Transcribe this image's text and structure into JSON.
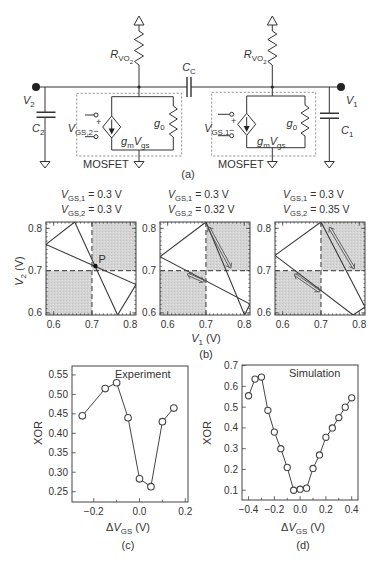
{
  "figure": {
    "panel_labels": {
      "a": "(a)",
      "b": "(b)",
      "c": "(c)",
      "d": "(d)"
    }
  },
  "circuit": {
    "coupling_capacitor": [
      {
        "t": "C",
        "it": 1
      },
      {
        "t": "C",
        "sub": 1
      }
    ],
    "left": {
      "resistor": [
        {
          "t": "R",
          "it": 1
        },
        {
          "t": "VO",
          "sub": 1
        },
        {
          "t": "2",
          "subsub": 1
        }
      ],
      "node": [
        {
          "t": "V",
          "it": 1
        },
        {
          "t": "2",
          "sub": 1
        }
      ],
      "capacitor": [
        {
          "t": "C",
          "it": 1
        },
        {
          "t": "2",
          "sub": 1
        }
      ],
      "gate_input": [
        {
          "t": "V",
          "it": 1
        },
        {
          "t": "GS,2",
          "sub": 1
        }
      ],
      "conductance": [
        {
          "t": "g",
          "it": 1
        },
        {
          "t": "0",
          "sub": 1
        }
      ],
      "current_source": [
        {
          "t": "g",
          "it": 1
        },
        {
          "t": "m",
          "sub": 1
        },
        {
          "t": "V",
          "it": 1
        },
        {
          "t": "gs",
          "sub": 1
        }
      ],
      "plus": "+",
      "minus": "−",
      "box_label": "MOSFET"
    },
    "right": {
      "resistor": [
        {
          "t": "R",
          "it": 1
        },
        {
          "t": "VO",
          "sub": 1
        },
        {
          "t": "2",
          "subsub": 1
        }
      ],
      "node": [
        {
          "t": "V",
          "it": 1
        },
        {
          "t": "1",
          "sub": 1
        }
      ],
      "capacitor": [
        {
          "t": "C",
          "it": 1
        },
        {
          "t": "1",
          "sub": 1
        }
      ],
      "gate_input": [
        {
          "t": "V",
          "it": 1
        },
        {
          "t": "GS,1",
          "sub": 1
        }
      ],
      "conductance": [
        {
          "t": "g",
          "it": 1
        },
        {
          "t": "0",
          "sub": 1
        }
      ],
      "current_source": [
        {
          "t": "g",
          "it": 1
        },
        {
          "t": "m",
          "sub": 1
        },
        {
          "t": "V",
          "it": 1
        },
        {
          "t": "gs",
          "sub": 1
        }
      ],
      "plus": "+",
      "minus": "−",
      "box_label": "MOSFET"
    }
  },
  "chart_data": [
    {
      "type": "line",
      "panel": "(b)",
      "title": "V_GS,1 = 0.3 V; V_GS,2 = 0.3 V",
      "title_parts": [
        [
          {
            "t": "V",
            "it": 1
          },
          {
            "t": "GS,1",
            "sub": 1
          },
          {
            "t": " = 0.3 V"
          }
        ],
        [
          {
            "t": "V",
            "it": 1
          },
          {
            "t": "GS,2",
            "sub": 1
          },
          {
            "t": " = 0.3 V"
          }
        ]
      ],
      "params": {
        "V_GS1": 0.3,
        "V_GS2": 0.3
      },
      "xlabel": "",
      "ylabel": "V_2 (V)",
      "ylabel_parts": [
        {
          "t": "V",
          "it": 1
        },
        {
          "t": "2",
          "sub": 1
        },
        {
          "t": " (V)"
        }
      ],
      "xlim": [
        0.58,
        0.815
      ],
      "ylim": [
        0.595,
        0.815
      ],
      "xticks": [
        0.6,
        0.7,
        0.8
      ],
      "xtick_labels": [
        "0.6",
        "0.7",
        "0.8"
      ],
      "yticks": [
        0.6,
        0.7,
        0.8
      ],
      "ytick_labels": [
        "0.6",
        "0.7",
        "0.8"
      ],
      "minor_tick_step": 0.01,
      "mirror_ticks": true,
      "grid": false,
      "threshold_lines": {
        "x": 0.7,
        "y": 0.7
      },
      "shaded_regions": [
        {
          "x": [
            0.7,
            0.815
          ],
          "y": [
            0.7,
            0.815
          ]
        },
        {
          "x": [
            0.58,
            0.7
          ],
          "y": [
            0.595,
            0.7
          ]
        }
      ],
      "curves": [
        {
          "name": "nullclines",
          "points": [
            [
              0.58,
              0.762
            ],
            [
              0.655,
              0.815
            ],
            [
              0.767,
              0.595
            ],
            [
              0.815,
              0.667
            ],
            [
              0.58,
              0.762
            ]
          ]
        }
      ],
      "markers": [
        {
          "x": 0.709,
          "y": 0.711,
          "label": "P"
        }
      ]
    },
    {
      "type": "line",
      "panel": "(b)",
      "title": "V_GS,1 = 0.3 V; V_GS,2 = 0.32 V",
      "title_parts": [
        [
          {
            "t": "V",
            "it": 1
          },
          {
            "t": "GS,1",
            "sub": 1
          },
          {
            "t": " = 0.3 V"
          }
        ],
        [
          {
            "t": "V",
            "it": 1
          },
          {
            "t": "GS,2",
            "sub": 1
          },
          {
            "t": " = 0.32 V"
          }
        ]
      ],
      "params": {
        "V_GS1": 0.3,
        "V_GS2": 0.32
      },
      "xlabel": "V_1 (V)",
      "xlabel_parts": [
        {
          "t": "V",
          "it": 1
        },
        {
          "t": "1",
          "sub": 1
        },
        {
          "t": " (V)"
        }
      ],
      "ylabel": "",
      "xlim": [
        0.58,
        0.815
      ],
      "ylim": [
        0.595,
        0.815
      ],
      "xticks": [
        0.6,
        0.7,
        0.8
      ],
      "xtick_labels": [
        "0.6",
        "0.7",
        "0.8"
      ],
      "yticks": [
        0.6,
        0.7,
        0.8
      ],
      "ytick_labels": [
        "0.6",
        "0.7",
        "0.8"
      ],
      "minor_tick_step": 0.01,
      "mirror_ticks": true,
      "grid": false,
      "threshold_lines": {
        "x": 0.7,
        "y": 0.7
      },
      "shaded_regions": [
        {
          "x": [
            0.7,
            0.815
          ],
          "y": [
            0.7,
            0.815
          ]
        },
        {
          "x": [
            0.58,
            0.7
          ],
          "y": [
            0.595,
            0.7
          ]
        }
      ],
      "curves": [
        {
          "name": "nullclines",
          "points": [
            [
              0.58,
              0.733
            ],
            [
              0.7,
              0.815
            ],
            [
              0.801,
              0.595
            ],
            [
              0.815,
              0.621
            ],
            [
              0.58,
              0.733
            ]
          ]
        }
      ],
      "arrows": [
        {
          "from": [
            0.706,
            0.804
          ],
          "to": [
            0.765,
            0.706
          ]
        },
        {
          "from": [
            0.651,
            0.692
          ],
          "to": [
            0.696,
            0.674
          ]
        }
      ]
    },
    {
      "type": "line",
      "panel": "(b)",
      "title": "V_GS,1 = 0.3 V; V_GS,2 = 0.35 V",
      "title_parts": [
        [
          {
            "t": "V",
            "it": 1
          },
          {
            "t": "GS,1",
            "sub": 1
          },
          {
            "t": " = 0.3 V"
          }
        ],
        [
          {
            "t": "V",
            "it": 1
          },
          {
            "t": "GS,2",
            "sub": 1
          },
          {
            "t": " = 0.35 V"
          }
        ]
      ],
      "params": {
        "V_GS1": 0.3,
        "V_GS2": 0.35
      },
      "xlabel": "",
      "ylabel": "",
      "xlim": [
        0.58,
        0.815
      ],
      "ylim": [
        0.595,
        0.815
      ],
      "xticks": [
        0.6,
        0.7,
        0.8
      ],
      "xtick_labels": [
        "0.6",
        "0.7",
        "0.8"
      ],
      "yticks": [
        0.6,
        0.7,
        0.8
      ],
      "ytick_labels": [
        "0.6",
        "0.7",
        "0.8"
      ],
      "minor_tick_step": 0.01,
      "mirror_ticks": true,
      "grid": false,
      "threshold_lines": {
        "x": 0.7,
        "y": 0.7
      },
      "shaded_regions": [
        {
          "x": [
            0.7,
            0.815
          ],
          "y": [
            0.7,
            0.815
          ]
        },
        {
          "x": [
            0.58,
            0.7
          ],
          "y": [
            0.595,
            0.7
          ]
        }
      ],
      "curves": [
        {
          "name": "nullclines",
          "points": [
            [
              0.58,
              0.736
            ],
            [
              0.7,
              0.815
            ],
            [
              0.815,
              0.614
            ],
            [
              0.784,
              0.595
            ],
            [
              0.58,
              0.736
            ]
          ]
        }
      ],
      "arrows": [
        {
          "from": [
            0.722,
            0.803
          ],
          "to": [
            0.787,
            0.704
          ]
        },
        {
          "from": [
            0.63,
            0.692
          ],
          "to": [
            0.697,
            0.65
          ]
        }
      ]
    },
    {
      "type": "line",
      "panel": "(c)",
      "title": "Experiment",
      "xlabel": "ΔV_GS (V)",
      "xlabel_parts": [
        {
          "t": "Δ"
        },
        {
          "t": "V",
          "it": 1
        },
        {
          "t": "GS",
          "sub": 1
        },
        {
          "t": " (V)"
        }
      ],
      "ylabel": "XOR",
      "xlim": [
        -0.295,
        0.212
      ],
      "ylim": [
        0.2235,
        0.573
      ],
      "xticks": [
        -0.2,
        0.0,
        0.2
      ],
      "xtick_labels": [
        "−0.2",
        "0.0",
        "0.2"
      ],
      "xminor": [
        -0.1,
        0.1
      ],
      "yticks": [
        0.25,
        0.3,
        0.35,
        0.4,
        0.45,
        0.5,
        0.55
      ],
      "ytick_labels": [
        "0.25",
        "0.30",
        "0.35",
        "0.40",
        "0.45",
        "0.50",
        "0.55"
      ],
      "grid": false,
      "legend": "none",
      "series": [
        {
          "name": "Experiment",
          "marker": "open-circle",
          "marker_r": 3.3,
          "x": [
            -0.25,
            -0.15,
            -0.1,
            -0.05,
            0.0,
            0.05,
            0.1,
            0.15
          ],
          "y": [
            0.445,
            0.515,
            0.53,
            0.44,
            0.283,
            0.263,
            0.43,
            0.465
          ]
        }
      ]
    },
    {
      "type": "line",
      "panel": "(d)",
      "title": "Simulation",
      "xlabel": "ΔV_GS (V)",
      "xlabel_parts": [
        {
          "t": "Δ"
        },
        {
          "t": "V",
          "it": 1
        },
        {
          "t": "GS",
          "sub": 1
        },
        {
          "t": " (V)"
        }
      ],
      "ylabel": "XOR",
      "xlim": [
        -0.451,
        0.449
      ],
      "ylim": [
        0.053,
        0.703
      ],
      "xticks": [
        -0.4,
        -0.2,
        0.0,
        0.2,
        0.4
      ],
      "xtick_labels": [
        "−0.4",
        "−0.2",
        "0.0",
        "0.2",
        "0.4"
      ],
      "xminor": [
        -0.3,
        -0.1,
        0.1,
        0.3
      ],
      "yticks": [
        0.1,
        0.2,
        0.3,
        0.4,
        0.5,
        0.6,
        0.7
      ],
      "ytick_labels": [
        "0.1",
        "0.2",
        "0.3",
        "0.4",
        "0.5",
        "0.6",
        "0.7"
      ],
      "grid": false,
      "legend": "none",
      "series": [
        {
          "name": "Simulation",
          "marker": "open-circle",
          "marker_r": 3.1,
          "x": [
            -0.4,
            -0.35,
            -0.3,
            -0.25,
            -0.2,
            -0.15,
            -0.1,
            -0.05,
            0.0,
            0.05,
            0.1,
            0.15,
            0.2,
            0.25,
            0.3,
            0.35,
            0.4
          ],
          "y": [
            0.555,
            0.635,
            0.645,
            0.485,
            0.38,
            0.3,
            0.21,
            0.1,
            0.105,
            0.11,
            0.205,
            0.27,
            0.355,
            0.4,
            0.45,
            0.5,
            0.545
          ]
        }
      ]
    }
  ]
}
